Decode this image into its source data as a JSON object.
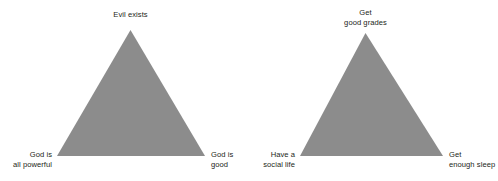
{
  "figure": {
    "background_color": "#ffffff",
    "triangle_fill_color": "#8c8c8c",
    "label_text_color": "#231f20"
  },
  "diagrams": [
    {
      "name": "problem-of-evil-trilemma",
      "apex": {
        "lines": [
          "Evil exists"
        ]
      },
      "bottom_left": {
        "lines": [
          "God is",
          "all powerful"
        ]
      },
      "bottom_right": {
        "lines": [
          "God is",
          "good"
        ]
      }
    },
    {
      "name": "student-trilemma",
      "apex": {
        "lines": [
          "Get",
          "good grades"
        ]
      },
      "bottom_left": {
        "lines": [
          "Have a",
          "social life"
        ]
      },
      "bottom_right": {
        "lines": [
          "Get",
          "enough sleep"
        ]
      }
    }
  ]
}
